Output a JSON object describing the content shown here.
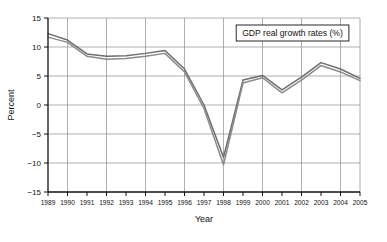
{
  "chart_data": {
    "type": "line",
    "title": "",
    "xlabel": "Year",
    "ylabel": "Percent",
    "legend_position": "top-right",
    "legend_entries": [
      "GDP real growth rates (%)"
    ],
    "grid": true,
    "xlim": [
      1989,
      2005
    ],
    "ylim": [
      -15,
      15
    ],
    "yticks": [
      15,
      10,
      5,
      0,
      -5,
      -10,
      -15
    ],
    "ytick_labels": [
      "15",
      "10",
      "5",
      "0",
      "-5",
      "-10",
      "-15"
    ],
    "x": [
      1989,
      1990,
      1991,
      1992,
      1993,
      1994,
      1995,
      1996,
      1997,
      1998,
      1999,
      2000,
      2001,
      2002,
      2003,
      2004,
      2005
    ],
    "xtick_labels": [
      "1989",
      "1990",
      "1991",
      "1992",
      "1993",
      "1994",
      "1995",
      "1996",
      "1997",
      "1998",
      "1999",
      "2000",
      "2001",
      "2002",
      "2003",
      "2004",
      "2005"
    ],
    "series": [
      {
        "name": "GDP real growth rates (%) - upper",
        "color": "#6e6e6e",
        "values": [
          12.3,
          11.2,
          8.8,
          8.4,
          8.5,
          8.9,
          9.4,
          6.2,
          0.0,
          -9.0,
          4.3,
          5.1,
          2.6,
          4.8,
          7.3,
          6.2,
          4.6
        ]
      },
      {
        "name": "GDP real growth rates (%) - lower",
        "color": "#8a8a8a",
        "values": [
          11.7,
          10.8,
          8.4,
          7.9,
          8.0,
          8.4,
          8.9,
          5.7,
          -0.6,
          -10.3,
          3.8,
          4.7,
          2.1,
          4.3,
          6.8,
          5.7,
          4.2
        ]
      }
    ]
  },
  "legend": {
    "label": "GDP real growth rates (%)"
  },
  "axes": {
    "y_title": "Percent",
    "x_title": "Year"
  }
}
